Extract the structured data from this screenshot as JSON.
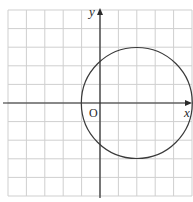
{
  "diagram": {
    "type": "coordinate-plane-circle",
    "axes": {
      "x_label": "x",
      "y_label": "y",
      "origin_label": "O"
    },
    "grid": {
      "x_min": -5,
      "x_max": 5,
      "y_min": -5,
      "y_max": 5,
      "step": 1
    },
    "circle": {
      "center": [
        2,
        0
      ],
      "radius": 3
    },
    "colors": {
      "grid": "#cfcfcf",
      "axis": "#2a2a2a",
      "circle": "#3a3a3a"
    }
  }
}
